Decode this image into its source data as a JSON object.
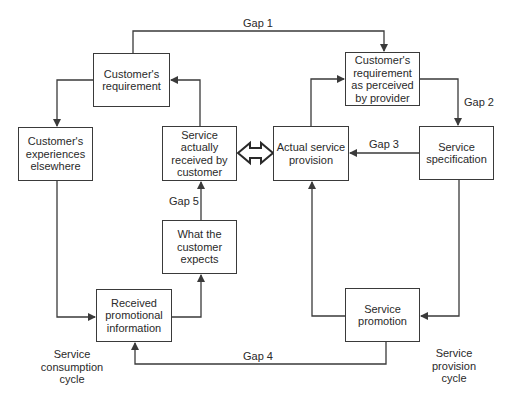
{
  "diagram": {
    "type": "gap-model-flowchart",
    "boxes": {
      "customers_requirement": "Customer's requirement",
      "customers_experiences": "Customer's experiences elsewhere",
      "service_received": "Service actually received by customer",
      "customer_expects": "What the customer expects",
      "received_promo": "Received promotional information",
      "actual_provision": "Actual service provision",
      "perceived_requirement": "Customer's requirement as perceived by provider",
      "service_spec": "Service specification",
      "service_promotion": "Service promotion"
    },
    "gaps": {
      "gap1": "Gap 1",
      "gap2": "Gap 2",
      "gap3": "Gap 3",
      "gap4": "Gap 4",
      "gap5": "Gap 5"
    },
    "cycles": {
      "consumption": "Service consumption cycle",
      "provision": "Service provision cycle"
    },
    "colors": {
      "line": "#3a3a3a",
      "text": "#2a2a2a",
      "background": "#ffffff"
    }
  }
}
